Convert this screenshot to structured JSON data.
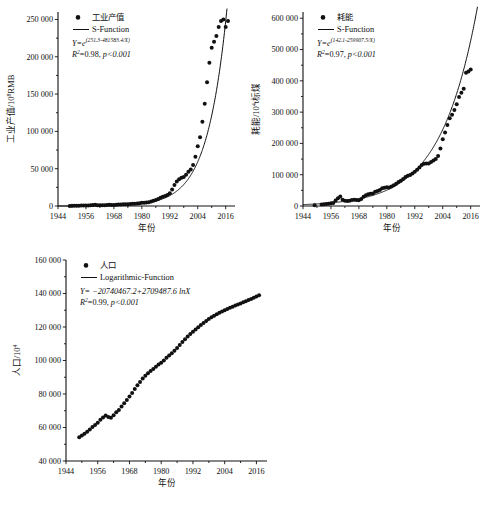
{
  "figure": {
    "caption": ""
  },
  "chart_data": [
    {
      "id": "industry",
      "type": "scatter",
      "title": "",
      "xlabel": "年份",
      "ylabel": "工业产值/10⁸RMB",
      "ylabel_main": "工业产值/10",
      "ylabel_exp": "8",
      "ylabel_tail": "RMB",
      "xlim": [
        1944,
        2020
      ],
      "ylim": [
        0,
        260000
      ],
      "xticks": [
        1944,
        1956,
        1968,
        1980,
        1992,
        2004,
        2016
      ],
      "yticks": [
        0,
        50000,
        100000,
        150000,
        200000,
        250000
      ],
      "ytick_labels": [
        "0",
        "50 000",
        "100 000",
        "150 000",
        "200 000",
        "250 000"
      ],
      "grid": false,
      "legend_position": "top-left",
      "legend": [
        {
          "marker": "dot",
          "label": "工业产值"
        },
        {
          "marker": "line",
          "label": "S-Function"
        }
      ],
      "annotations": {
        "equation_lhs": "Y=e",
        "equation_exp": "(251.3-481583.4/X)",
        "r2_label": "R",
        "r2_sup": "2",
        "r2_value": "=0.98,",
        "p_value": "p<0.001"
      },
      "fit": {
        "type": "s-function",
        "a": 251.3,
        "b": 481583.4
      },
      "x": [
        1949,
        1950,
        1951,
        1952,
        1953,
        1954,
        1955,
        1956,
        1957,
        1958,
        1959,
        1960,
        1961,
        1962,
        1963,
        1964,
        1965,
        1966,
        1967,
        1968,
        1969,
        1970,
        1971,
        1972,
        1973,
        1974,
        1975,
        1976,
        1977,
        1978,
        1979,
        1980,
        1981,
        1982,
        1983,
        1984,
        1985,
        1986,
        1987,
        1988,
        1989,
        1990,
        1991,
        1992,
        1993,
        1994,
        1995,
        1996,
        1997,
        1998,
        1999,
        2000,
        2001,
        2002,
        2003,
        2004,
        2005,
        2006,
        2007,
        2008,
        2009,
        2010,
        2011,
        2012,
        2013,
        2014,
        2015,
        2016,
        2017
      ],
      "values": [
        140,
        190,
        260,
        340,
        450,
        520,
        540,
        640,
        700,
        1080,
        1250,
        1640,
        1070,
        920,
        1000,
        1160,
        1400,
        1620,
        1380,
        1290,
        1640,
        1900,
        2080,
        2180,
        2440,
        2500,
        2800,
        2900,
        3150,
        3500,
        3800,
        4200,
        4400,
        4700,
        5100,
        5900,
        7100,
        8200,
        9500,
        11000,
        12500,
        13500,
        14800,
        17200,
        22000,
        28000,
        33000,
        36000,
        38000,
        39000,
        42000,
        46000,
        49000,
        55000,
        66000,
        80000,
        92000,
        113000,
        137000,
        166000,
        192000,
        212000,
        220000,
        228000,
        240000,
        248000,
        250000,
        240000,
        248000
      ]
    },
    {
      "id": "energy",
      "type": "scatter",
      "title": "",
      "xlabel": "年份",
      "ylabel": "耗能/10⁴t标煤",
      "ylabel_main": "耗能/10",
      "ylabel_exp": "4",
      "ylabel_tail": "t标煤",
      "xlim": [
        1944,
        2020
      ],
      "ylim": [
        0,
        620000
      ],
      "xticks": [
        1944,
        1956,
        1968,
        1980,
        1992,
        2004,
        2016
      ],
      "yticks": [
        0,
        100000,
        200000,
        300000,
        400000,
        500000,
        600000
      ],
      "ytick_labels": [
        "0",
        "100 000",
        "200 000",
        "300 000",
        "400 000",
        "500 000",
        "600 000"
      ],
      "grid": false,
      "legend_position": "top-left",
      "legend": [
        {
          "marker": "dot",
          "label": "耗能"
        },
        {
          "marker": "line",
          "label": "S-Function"
        }
      ],
      "annotations": {
        "equation_lhs": "Y=e",
        "equation_exp": "(142.1-259907.5/X)",
        "r2_label": "R",
        "r2_sup": "2",
        "r2_value": "=0.97,",
        "p_value": "p<0.001"
      },
      "fit": {
        "type": "s-function",
        "a": 142.1,
        "b": 259907.5
      },
      "x": [
        1949,
        1952,
        1953,
        1954,
        1955,
        1956,
        1957,
        1958,
        1959,
        1960,
        1961,
        1962,
        1963,
        1964,
        1965,
        1966,
        1967,
        1968,
        1969,
        1970,
        1971,
        1972,
        1973,
        1974,
        1975,
        1976,
        1977,
        1978,
        1979,
        1980,
        1981,
        1982,
        1983,
        1984,
        1985,
        1986,
        1987,
        1988,
        1989,
        1990,
        1991,
        1992,
        1993,
        1994,
        1995,
        1996,
        1997,
        1998,
        1999,
        2000,
        2001,
        2002,
        2003,
        2004,
        2005,
        2006,
        2007,
        2008,
        2009,
        2010,
        2011,
        2012,
        2013,
        2014,
        2015,
        2016
      ],
      "values": [
        2300,
        4800,
        5400,
        6200,
        6900,
        8800,
        9600,
        17500,
        25000,
        30100,
        20300,
        16500,
        15600,
        16800,
        18900,
        20300,
        18800,
        18500,
        22700,
        29300,
        34100,
        37300,
        39100,
        40100,
        45400,
        47800,
        51200,
        57100,
        58600,
        60300,
        59400,
        62000,
        66000,
        70900,
        76700,
        80900,
        86600,
        93000,
        96900,
        98700,
        103800,
        109200,
        115900,
        122700,
        131200,
        135200,
        135900,
        136200,
        140600,
        145500,
        150400,
        159400,
        183800,
        213500,
        235000,
        258700,
        280500,
        291400,
        306600,
        324900,
        348000,
        361700,
        375000,
        425800,
        430000,
        436000
      ]
    },
    {
      "id": "population",
      "type": "scatter",
      "title": "",
      "xlabel": "年份",
      "ylabel": "人口/10⁴",
      "ylabel_main": "人口/10",
      "ylabel_exp": "4",
      "ylabel_tail": "",
      "xlim": [
        1944,
        2020
      ],
      "ylim": [
        40000,
        160000
      ],
      "xticks": [
        1944,
        1956,
        1968,
        1980,
        1992,
        2004,
        2016
      ],
      "yticks": [
        40000,
        60000,
        80000,
        100000,
        120000,
        140000,
        160000
      ],
      "ytick_labels": [
        "40 000",
        "60 000",
        "80 000",
        "100 000",
        "120 000",
        "140 000",
        "160 000"
      ],
      "grid": false,
      "legend_position": "top-left",
      "legend": [
        {
          "marker": "dot",
          "label": "人口"
        },
        {
          "marker": "line",
          "label": "Logarithmic-Function"
        }
      ],
      "annotations": {
        "equation_lhs": "Y= −20740467.2+2709487.6 ln",
        "equation_var": "X",
        "r2_label": "R",
        "r2_sup": "2",
        "r2_value": "=0.99,",
        "p_value": "p<0.001"
      },
      "fit": {
        "type": "logarithmic",
        "a": -20740467.2,
        "b": 2709487.6
      },
      "x": [
        1949,
        1950,
        1951,
        1952,
        1953,
        1954,
        1955,
        1956,
        1957,
        1958,
        1959,
        1960,
        1961,
        1962,
        1963,
        1964,
        1965,
        1966,
        1967,
        1968,
        1969,
        1970,
        1971,
        1972,
        1973,
        1974,
        1975,
        1976,
        1977,
        1978,
        1979,
        1980,
        1981,
        1982,
        1983,
        1984,
        1985,
        1986,
        1987,
        1988,
        1989,
        1990,
        1991,
        1992,
        1993,
        1994,
        1995,
        1996,
        1997,
        1998,
        1999,
        2000,
        2001,
        2002,
        2003,
        2004,
        2005,
        2006,
        2007,
        2008,
        2009,
        2010,
        2011,
        2012,
        2013,
        2014,
        2015,
        2016,
        2017
      ],
      "values": [
        54167,
        55196,
        56300,
        57482,
        58796,
        60266,
        61465,
        62828,
        64653,
        65994,
        67207,
        66207,
        65859,
        67295,
        69172,
        70499,
        72538,
        74542,
        76368,
        78534,
        80671,
        82992,
        85229,
        87177,
        89211,
        90859,
        92420,
        93717,
        94974,
        96259,
        97542,
        98705,
        100072,
        101654,
        103008,
        104357,
        105851,
        107507,
        109300,
        111026,
        112704,
        114333,
        115823,
        117171,
        118517,
        119850,
        121121,
        122389,
        123626,
        124761,
        125786,
        126743,
        127627,
        128453,
        129227,
        129988,
        130756,
        131448,
        132129,
        132802,
        133450,
        134091,
        134735,
        135404,
        136072,
        136782,
        137462,
        138271,
        139008
      ]
    }
  ]
}
